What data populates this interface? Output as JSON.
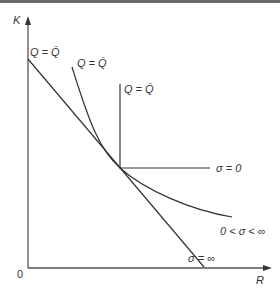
{
  "diagram": {
    "axes": {
      "y_label": "K",
      "x_label": "R",
      "origin_label": "0"
    },
    "isoquants": [
      {
        "id": "perfect-substitutes",
        "top_label": "Q = Q̄",
        "end_label": "σ = ∞"
      },
      {
        "id": "cobb-douglas-like",
        "top_label": "Q = Q̄",
        "end_label": "0 < σ < ∞"
      },
      {
        "id": "leontief",
        "top_label": "Q = Q̄",
        "end_label": "σ = 0"
      }
    ],
    "colors": {
      "line": "#333333",
      "axis": "#555555",
      "top_bar": "#6a6a6a"
    }
  }
}
